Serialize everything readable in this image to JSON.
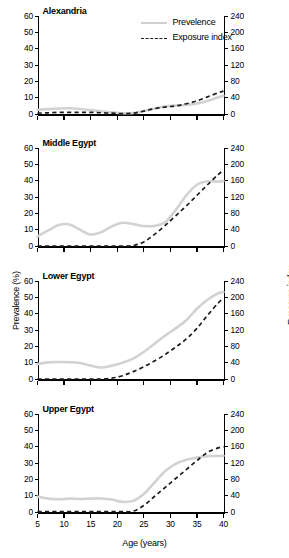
{
  "figure": {
    "xaxis_title": "Age (years)",
    "yaxis_left_title": "Prevalence (%)",
    "yaxis_right_title": "Exposure index"
  },
  "legend": {
    "items": [
      {
        "label": "Prevelence",
        "style": "solid",
        "color": "#d2d2d2"
      },
      {
        "label": "Exposure index",
        "style": "dashed",
        "color": "#1c1c1c"
      }
    ]
  },
  "axes": {
    "x_ticks": [
      5,
      10,
      15,
      20,
      25,
      30,
      35,
      40
    ],
    "y_left_ticks": [
      0,
      10,
      20,
      30,
      40,
      50,
      60
    ],
    "y_right_ticks": [
      0,
      40,
      80,
      120,
      160,
      200,
      240
    ]
  },
  "chart_data": [
    {
      "type": "line",
      "title": "Alexandria",
      "xlabel": "Age (years)",
      "ylabel": "Prevalence (%)",
      "ylabel_right": "Exposure index",
      "xlim": [
        5,
        40
      ],
      "ylim": [
        0,
        60
      ],
      "ylim_right": [
        0,
        240
      ],
      "grid": false,
      "legend_position": "top-center",
      "x": [
        5,
        7,
        9,
        11,
        13,
        15,
        17,
        19,
        21,
        23,
        25,
        27,
        29,
        31,
        33,
        35,
        37,
        39,
        40
      ],
      "series": [
        {
          "name": "Prevelence",
          "axis": "left",
          "values": [
            2.6,
            3.0,
            3.4,
            3.5,
            3.1,
            2.4,
            1.7,
            1.0,
            0.5,
            0.6,
            1.8,
            3.4,
            4.6,
            5.2,
            5.6,
            6.4,
            8.0,
            10.2,
            11.2
          ]
        },
        {
          "name": "Exposure index",
          "axis": "right",
          "values": [
            2,
            3,
            4,
            4,
            4,
            4,
            3,
            2,
            1,
            2,
            7,
            13,
            17,
            20,
            25,
            32,
            42,
            52,
            56
          ]
        }
      ]
    },
    {
      "type": "line",
      "title": "Middle Egypt",
      "xlabel": "Age (years)",
      "ylabel": "Prevalence (%)",
      "ylabel_right": "Exposure index",
      "xlim": [
        5,
        40
      ],
      "ylim": [
        0,
        60
      ],
      "ylim_right": [
        0,
        240
      ],
      "grid": false,
      "x": [
        5,
        7,
        9,
        11,
        13,
        15,
        17,
        19,
        21,
        23,
        25,
        27,
        29,
        31,
        33,
        35,
        37,
        39,
        40
      ],
      "series": [
        {
          "name": "Prevelence",
          "axis": "left",
          "values": [
            5.8,
            9.5,
            12.8,
            13.2,
            10.0,
            7.0,
            8.5,
            12.0,
            14.2,
            13.4,
            12.2,
            12.3,
            14.5,
            22.0,
            31.0,
            37.5,
            39.6,
            39.4,
            39.8
          ]
        },
        {
          "name": "Exposure index",
          "axis": "right",
          "values": [
            0,
            0,
            0,
            0,
            0,
            0,
            0,
            0,
            0,
            1,
            10,
            28,
            50,
            74,
            98,
            124,
            150,
            175,
            185
          ]
        }
      ]
    },
    {
      "type": "line",
      "title": "Lower Egypt",
      "xlabel": "Age (years)",
      "ylabel": "Prevalence (%)",
      "ylabel_right": "Exposure index",
      "xlim": [
        5,
        40
      ],
      "ylim": [
        0,
        60
      ],
      "ylim_right": [
        0,
        240
      ],
      "grid": false,
      "x": [
        5,
        7,
        9,
        11,
        13,
        15,
        17,
        19,
        21,
        23,
        25,
        27,
        29,
        31,
        33,
        35,
        37,
        39,
        40
      ],
      "series": [
        {
          "name": "Prevelence",
          "axis": "left",
          "values": [
            9.2,
            10.2,
            10.4,
            10.3,
            9.8,
            8.2,
            7.0,
            8.2,
            10.0,
            12.5,
            16.5,
            21.5,
            26.5,
            31.0,
            36.0,
            43.0,
            48.5,
            52.5,
            53.2
          ]
        },
        {
          "name": "Exposure index",
          "axis": "right",
          "values": [
            0,
            0,
            0,
            0,
            0,
            0,
            0,
            2,
            8,
            18,
            30,
            44,
            60,
            78,
            98,
            124,
            156,
            186,
            198
          ]
        }
      ]
    },
    {
      "type": "line",
      "title": "Upper Egypt",
      "xlabel": "Age (years)",
      "ylabel": "Prevalence (%)",
      "ylabel_right": "Exposure index",
      "xlim": [
        5,
        40
      ],
      "ylim": [
        0,
        60
      ],
      "ylim_right": [
        0,
        240
      ],
      "grid": false,
      "x": [
        5,
        7,
        9,
        11,
        13,
        15,
        17,
        19,
        21,
        23,
        25,
        27,
        29,
        31,
        33,
        35,
        37,
        39,
        40
      ],
      "series": [
        {
          "name": "Prevelence",
          "axis": "left",
          "values": [
            9.4,
            8.2,
            7.8,
            8.2,
            8.0,
            8.2,
            8.3,
            7.6,
            6.2,
            6.8,
            11.0,
            18.0,
            25.0,
            29.5,
            32.0,
            33.4,
            34.2,
            34.3,
            34.4
          ]
        },
        {
          "name": "Exposure index",
          "axis": "right",
          "values": [
            1,
            1,
            1,
            1,
            1,
            1,
            1,
            1,
            1,
            2,
            16,
            38,
            60,
            82,
            104,
            126,
            146,
            157,
            160
          ]
        }
      ]
    }
  ]
}
